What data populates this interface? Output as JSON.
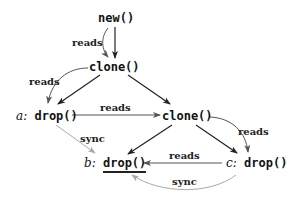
{
  "nodes": {
    "new": {
      "label": "new()"
    },
    "clone_top": {
      "label": "clone()"
    },
    "a_drop": {
      "var": "a",
      "sep": ":",
      "label": "drop()"
    },
    "clone_right": {
      "label": "clone()"
    },
    "b_drop": {
      "var": "b",
      "sep": ":",
      "label": "drop()",
      "underlined": true
    },
    "c_drop": {
      "var": "c",
      "sep": ":",
      "label": "drop()"
    }
  },
  "edges": [
    {
      "from": "new",
      "to": "clone_top",
      "style": "solid",
      "color": "#222222"
    },
    {
      "from": "clone_top",
      "to": "new",
      "label": "reads",
      "style": "curved",
      "color": "#555555"
    },
    {
      "from": "clone_top",
      "to": "a_drop",
      "style": "solid",
      "color": "#222222"
    },
    {
      "from": "clone_top",
      "to": "a_drop",
      "label": "reads",
      "style": "curved",
      "color": "#555555"
    },
    {
      "from": "clone_top",
      "to": "clone_right",
      "style": "solid",
      "color": "#222222"
    },
    {
      "from": "a_drop",
      "to": "clone_right",
      "label": "reads",
      "style": "solid",
      "color": "#555555"
    },
    {
      "from": "a_drop",
      "to": "b_drop",
      "label": "sync",
      "style": "solid",
      "color": "#aaaaaa"
    },
    {
      "from": "clone_right",
      "to": "b_drop",
      "style": "solid",
      "color": "#222222"
    },
    {
      "from": "clone_right",
      "to": "c_drop",
      "style": "solid",
      "color": "#222222"
    },
    {
      "from": "clone_right",
      "to": "c_drop",
      "label": "reads",
      "style": "curved",
      "color": "#555555"
    },
    {
      "from": "c_drop",
      "to": "b_drop",
      "label": "reads",
      "style": "solid",
      "color": "#555555"
    },
    {
      "from": "c_drop",
      "to": "b_drop",
      "label": "sync",
      "style": "curved",
      "color": "#aaaaaa"
    }
  ],
  "labels": {
    "reads_new": "reads",
    "reads_clone_a": "reads",
    "reads_a_clone": "reads",
    "sync_a_b": "sync",
    "reads_clone_c": "reads",
    "reads_c_b": "reads",
    "sync_c_b": "sync"
  }
}
